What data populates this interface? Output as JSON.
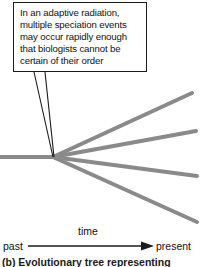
{
  "figure": {
    "callout": {
      "text": "In an adaptive radiation,\nmultiple speciation events\nmay occur rapidly enough\nthat biologists cannot be\ncertain of their order",
      "border_color": "#1b1b1b",
      "background": "#ffffff"
    },
    "axis": {
      "past_label": "past",
      "present_label": "present",
      "time_label": "time",
      "line_color": "#1b1b1b"
    },
    "tree": {
      "branch_color": "#8a8a8a",
      "leader_color": "#1b1b1b",
      "node": {
        "x": 53,
        "y": 157
      },
      "trunk": {
        "x1": 0,
        "y1": 157,
        "x2": 53,
        "y2": 157
      },
      "branches": [
        {
          "name": "branch-1-upper-steep",
          "x2": 192,
          "y2": 93
        },
        {
          "name": "branch-2-upper-shallow",
          "x2": 196,
          "y2": 131
        },
        {
          "name": "branch-3-lower-shallow",
          "x2": 197,
          "y2": 176
        },
        {
          "name": "branch-4-lower-steep",
          "x2": 197,
          "y2": 222
        }
      ],
      "leaders": [
        {
          "name": "leader-line-left",
          "x1": 34,
          "y1": 72,
          "x2": 53,
          "y2": 157
        },
        {
          "name": "leader-line-right",
          "x1": 45,
          "y1": 72,
          "x2": 54,
          "y2": 157
        }
      ]
    },
    "caption": "(b) Evolutionary tree representing"
  }
}
